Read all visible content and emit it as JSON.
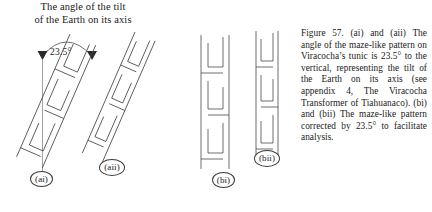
{
  "figure": {
    "background_color": "#ffffff",
    "ink_color": "#3a3a3a",
    "text_color": "#1a1a1a"
  },
  "tilt_diagram": {
    "heading_line1": "The angle of the tilt",
    "heading_line2": "of the Earth on its axis",
    "angle_value": "23.5°",
    "vertical_axis_name": "vertical reference line",
    "arc_name": "angle arc with arrowheads"
  },
  "panels": [
    {
      "id": "ai",
      "tag": "(ai)",
      "description": "maze-like meander pattern tilted 23.5° from vertical, wide band"
    },
    {
      "id": "aii",
      "tag": "(aii)",
      "description": "maze-like meander pattern tilted 23.5° from vertical, narrow band"
    },
    {
      "id": "bi",
      "tag": "(bi)",
      "description": "maze-like meander pattern corrected to vertical, wide band"
    },
    {
      "id": "bii",
      "tag": "(bii)",
      "description": "maze-like meander pattern corrected to vertical, narrow band"
    }
  ],
  "caption": {
    "text": "Figure 57. (ai) and (aii) The angle of the maze-like pattern on Viracocha’s tunic is 23.5° to the vertical, representing the tilt of the Earth on its axis (see appendix 4, The Viracocha Transformer of Tiahuanaco). (bi) and (bii) The maze-like pattern corrected by 23.5° to facilitate analysis."
  }
}
